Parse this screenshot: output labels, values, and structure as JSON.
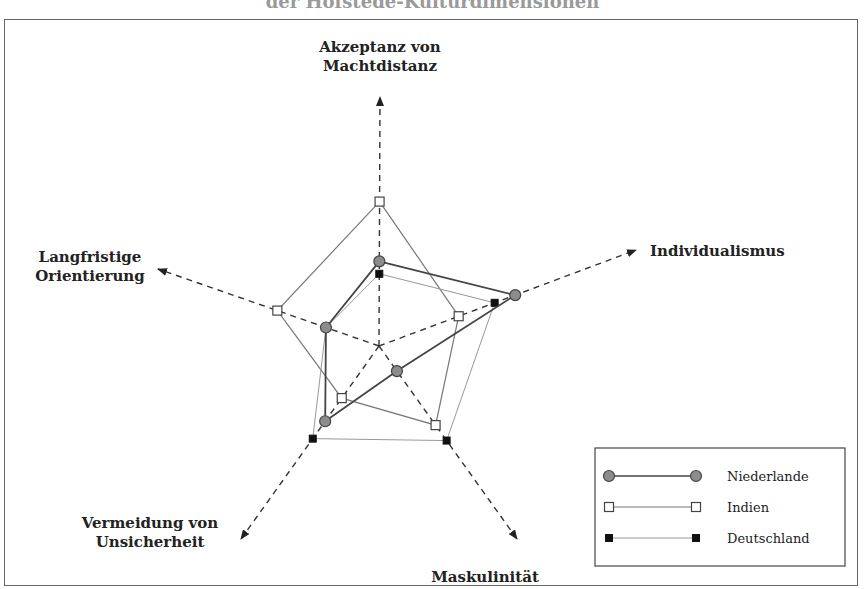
{
  "title": "der Hofstede-Kulturdimensionen",
  "chart_data": {
    "type": "radar",
    "title": "der Hofstede-Kulturdimensionen",
    "axes": [
      {
        "key": "pdi",
        "label_lines": [
          "Akzeptanz von",
          "Machtdistanz"
        ]
      },
      {
        "key": "idv",
        "label_lines": [
          "Individualismus"
        ]
      },
      {
        "key": "mas",
        "label_lines": [
          "Maskulinität"
        ]
      },
      {
        "key": "uai",
        "label_lines": [
          "Vermeidung von",
          "Unsicherheit"
        ]
      },
      {
        "key": "lto",
        "label_lines": [
          "Langfristige",
          "Orientierung"
        ]
      }
    ],
    "value_unit": "fraction of axis length (0-1)",
    "series": [
      {
        "name": "Niederlande",
        "marker": "circle",
        "color": "#8c8c8c",
        "line_color": "#444444",
        "values": {
          "pdi": 0.34,
          "idv": 0.53,
          "mas": 0.13,
          "uai": 0.39,
          "lto": 0.24
        }
      },
      {
        "name": "Indien",
        "marker": "open-square",
        "color": "#ffffff",
        "line_color": "#777777",
        "values": {
          "pdi": 0.58,
          "idv": 0.31,
          "mas": 0.41,
          "uai": 0.27,
          "lto": 0.46
        }
      },
      {
        "name": "Deutschland",
        "marker": "filled-square",
        "color": "#111111",
        "line_color": "#999999",
        "values": {
          "pdi": 0.29,
          "idv": 0.45,
          "mas": 0.49,
          "uai": 0.48,
          "lto": 0.24
        }
      }
    ],
    "legend_position": "bottom-right",
    "grid": false
  }
}
